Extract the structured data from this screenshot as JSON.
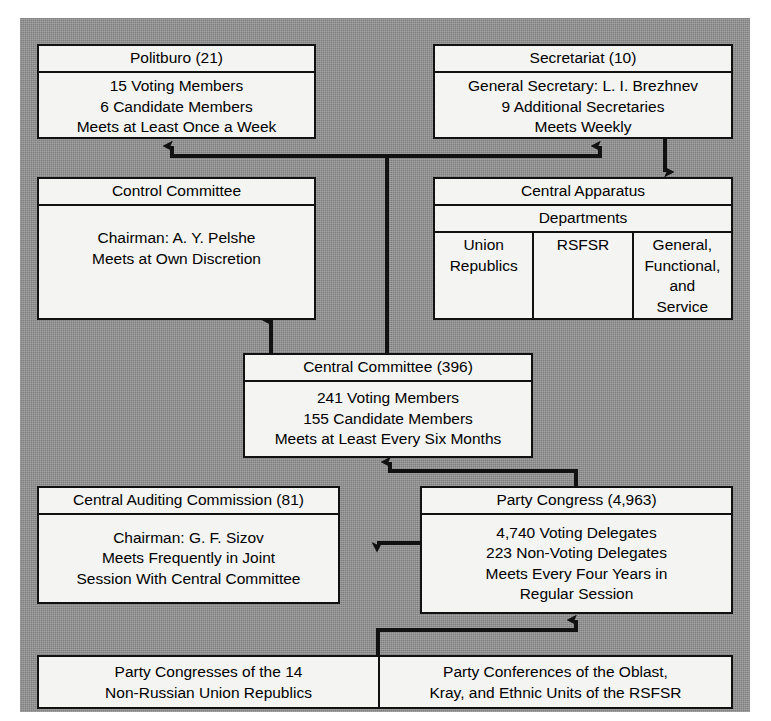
{
  "diagram": {
    "colors": {
      "background": "#8e8e8e",
      "box_fill": "#f4f4f2",
      "line": "#111111"
    }
  },
  "boxes": {
    "politburo": {
      "title": "Politburo (21)",
      "lines": [
        "15 Voting Members",
        "6 Candidate Members",
        "Meets at Least Once a Week"
      ]
    },
    "secretariat": {
      "title": "Secretariat (10)",
      "lines": [
        "General Secretary:  L. I. Brezhnev",
        "9 Additional  Secretaries",
        "Meets  Weekly"
      ]
    },
    "control_committee": {
      "title": "Control Committee",
      "lines": [
        "Chairman: A. Y. Pelshe",
        "Meets at Own Discretion"
      ]
    },
    "central_apparatus": {
      "title": "Central Apparatus",
      "subtitle": "Departments",
      "departments": [
        {
          "lines": [
            "Union",
            "Republics"
          ]
        },
        {
          "lines": [
            "RSFSR"
          ]
        },
        {
          "lines": [
            "General,",
            "Functional,",
            "and",
            "Service"
          ]
        }
      ]
    },
    "central_committee": {
      "title": "Central Committee (396)",
      "lines": [
        "241 Voting Members",
        "155 Candidate Members",
        "Meets at Least Every Six Months"
      ]
    },
    "auditing_commission": {
      "title": "Central Auditing Commission (81)",
      "lines": [
        "Chairman: G. F. Sizov",
        "Meets Frequently in Joint",
        "Session With Central Committee"
      ]
    },
    "party_congress": {
      "title": "Party Congress (4,963)",
      "lines": [
        "4,740 Voting Delegates",
        "223 Non-Voting Delegates",
        "Meets Every Four Years in",
        "Regular Session"
      ]
    },
    "republic_congresses": {
      "lines": [
        "Party Congresses of the 14",
        "Non-Russian Union Republics"
      ]
    },
    "oblast_conferences": {
      "lines": [
        "Party Conferences of the Oblast,",
        "Kray, and Ethnic Units of the  RSFSR"
      ]
    }
  },
  "connectors": [
    {
      "name": "central-committee-to-politburo-and-secretariat",
      "style": "bus-up-double-arrow"
    },
    {
      "name": "secretariat-to-central-apparatus",
      "style": "arrow-down"
    },
    {
      "name": "central-committee-to-control-committee",
      "style": "arrow-up"
    },
    {
      "name": "party-congress-to-central-committee",
      "style": "elbow-arrow-up"
    },
    {
      "name": "party-congress-to-auditing-commission",
      "style": "arrow-left"
    },
    {
      "name": "lower-bodies-to-party-congress",
      "style": "elbow-arrow-up"
    }
  ]
}
